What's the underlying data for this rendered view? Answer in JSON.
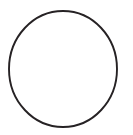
{
  "canvas": {
    "width": 133,
    "height": 135,
    "background_color": "#ffffff",
    "label": "circle-outline-figure"
  },
  "figure": {
    "type": "circle",
    "stroke_color": "#262224",
    "fill_color": "none",
    "stroke_width": 1.9,
    "center_x": 63,
    "center_y": 69,
    "radius_x": 54,
    "radius_y": 58
  },
  "annotations": {
    "text_items": [],
    "note": "No text, labels, axes, legend or other markings are present in the image"
  }
}
